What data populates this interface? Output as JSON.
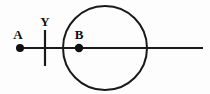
{
  "canvas": {
    "width": 210,
    "height": 94,
    "background_color": "#fdfdfd",
    "ink_color": "#1a1a1a",
    "label_color": "#111111"
  },
  "diagram": {
    "type": "line-and-circle-geometry",
    "axis": {
      "name": "horizontal-ray",
      "x1": 20,
      "y1": 48,
      "x2": 203,
      "y2": 48,
      "stroke_width": 2.2
    },
    "tick": {
      "name": "vertical-tick-Y",
      "label": "Y",
      "x": 45,
      "y1": 30,
      "y2": 66,
      "stroke_width": 2.2,
      "label_x": 45,
      "label_y": 26
    },
    "circle": {
      "name": "main-circle",
      "cx": 105,
      "cy": 48,
      "r": 42,
      "stroke_width": 2.0,
      "fill": "none"
    },
    "points": [
      {
        "id": "A",
        "label": "A",
        "cx": 20,
        "cy": 48,
        "r": 4,
        "label_x": 18,
        "label_y": 39
      },
      {
        "id": "B",
        "label": "B",
        "cx": 79,
        "cy": 48,
        "r": 4.2,
        "label_x": 79,
        "label_y": 39
      }
    ]
  }
}
